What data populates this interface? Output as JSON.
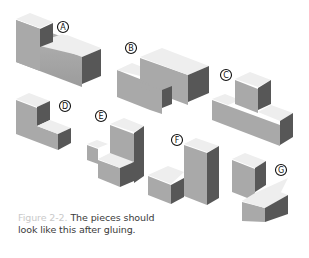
{
  "figure": {
    "pieces": [
      {
        "id": "A",
        "label": "A"
      },
      {
        "id": "B",
        "label": "B"
      },
      {
        "id": "C",
        "label": "C"
      },
      {
        "id": "D",
        "label": "D"
      },
      {
        "id": "E",
        "label": "E"
      },
      {
        "id": "F",
        "label": "F"
      },
      {
        "id": "G",
        "label": "G"
      }
    ],
    "colors": {
      "top": "#eeeeee",
      "left": "#a9a9a9",
      "right": "#575757",
      "label_ring": "#111111"
    }
  },
  "caption": {
    "figure_number": "Figure 2-2.",
    "text_line1": "The pieces should",
    "text_line2": "look like this after gluing."
  }
}
